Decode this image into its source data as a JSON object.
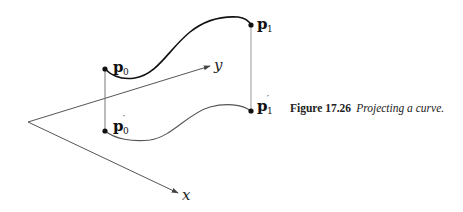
{
  "figure": {
    "number_label": "Figure 17.26",
    "caption_text": "Projecting a curve.",
    "axes": {
      "x_label": "x",
      "y_label": "y"
    },
    "points": {
      "p0": {
        "base": "p",
        "sub": "0",
        "prime": ""
      },
      "p0_prime": {
        "base": "p",
        "sub": "0",
        "prime": "′"
      },
      "p1": {
        "base": "p",
        "sub": "1",
        "prime": ""
      },
      "p1_prime": {
        "base": "p",
        "sub": "1",
        "prime": "′"
      }
    },
    "colors": {
      "curve": "#111111",
      "projected_curve": "#555555",
      "axis": "#555555",
      "projection_line": "#777777"
    }
  }
}
